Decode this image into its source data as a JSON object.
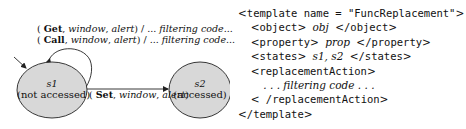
{
  "diagram": {
    "self_loop_labels": [
      {
        "event": "Get",
        "object": "window",
        "property": "alert",
        "action": "... filtering code..."
      },
      {
        "event": "Call",
        "object": "window",
        "property": "alert",
        "action": "... filtering code..."
      }
    ],
    "states": [
      {
        "id": "s1",
        "description": "(not accessed)"
      },
      {
        "id": "s2",
        "description": "(accessed)"
      }
    ],
    "transition_label": {
      "event": "Set",
      "object": "window",
      "property": "alert"
    },
    "colors": {
      "state_fill": "#d8d8d8",
      "stroke": "#222222"
    }
  },
  "template_code": {
    "open_tag": "template name = \"FuncReplacement\"",
    "object_tag": "object",
    "object_value": "obj",
    "property_tag": "property",
    "property_value": "prop",
    "states_tag": "states",
    "states_value": "s1, s2",
    "replacement_tag": "replacementAction",
    "replacement_body": ". . . filtering code . . .",
    "close_tag": "template"
  }
}
